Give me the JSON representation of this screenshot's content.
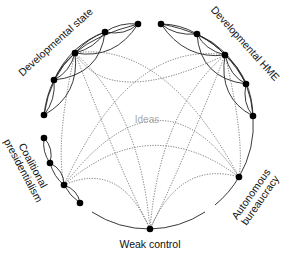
{
  "diagram": {
    "center_label": "Ideas",
    "clusters": [
      {
        "label": "Developmental state"
      },
      {
        "label": "Developmental HME"
      },
      {
        "label_line1": "Coalitional",
        "label_line2": "presidentialism"
      },
      {
        "label": "Weak control"
      },
      {
        "label_line1": "Autonomous",
        "label_line2": "bureaucracy"
      }
    ]
  }
}
